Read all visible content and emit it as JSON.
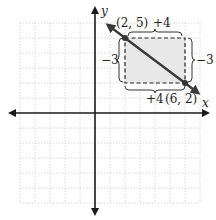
{
  "figure": {
    "type": "coordinate-plane",
    "x_axis_label": "x",
    "y_axis_label": "y",
    "grid": {
      "x_min": -5,
      "x_max": 7,
      "y_min": -6,
      "y_max": 6,
      "step": 1
    },
    "colors": {
      "line": "#3a3a3a",
      "grid": "#c8c8c8",
      "shade": "#e6e6e6",
      "dash": "#222222"
    }
  },
  "points": [
    {
      "label": "(2, 5)",
      "x": 2,
      "y": 5
    },
    {
      "label": "(6, 2)",
      "x": 6,
      "y": 2
    }
  ],
  "annotations": {
    "top_run": "+4",
    "bottom_run": "+4",
    "left_rise": "−3",
    "right_rise": "−3"
  }
}
